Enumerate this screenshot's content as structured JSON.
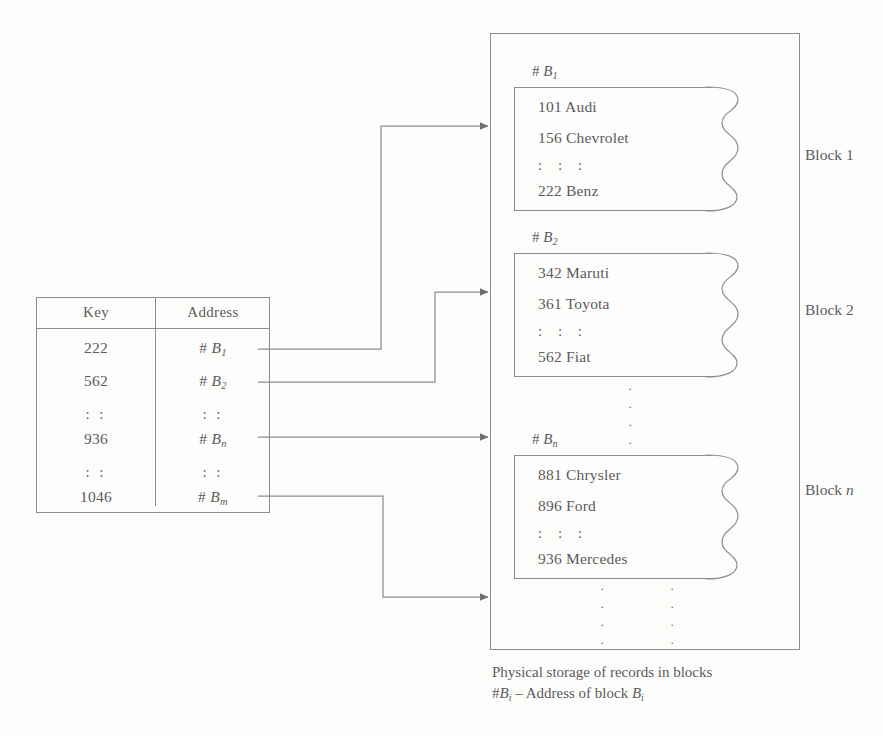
{
  "index_table": {
    "headers": [
      "Key",
      "Address"
    ],
    "rows": [
      {
        "key": "222",
        "address_prefix": "# ",
        "address_base": "B",
        "address_sub": "1"
      },
      {
        "key": "562",
        "address_prefix": "# ",
        "address_base": "B",
        "address_sub": "2"
      },
      {
        "key": ": :",
        "address_prefix": "",
        "address_base": ": :",
        "address_sub": ""
      },
      {
        "key": "936",
        "address_prefix": "# ",
        "address_base": "B",
        "address_sub": "n"
      },
      {
        "key": ": :",
        "address_prefix": "",
        "address_base": ": :",
        "address_sub": ""
      },
      {
        "key": "1046",
        "address_prefix": "# ",
        "address_base": "B",
        "address_sub": "m"
      }
    ]
  },
  "storage": {
    "blocks": [
      {
        "address_label_prefix": "# ",
        "address_label_base": "B",
        "address_label_sub": "1",
        "records": [
          "101 Audi",
          "156 Chevrolet",
          ": : :",
          "222 Benz"
        ],
        "caption": "Block 1"
      },
      {
        "address_label_prefix": "# ",
        "address_label_base": "B",
        "address_label_sub": "2",
        "records": [
          "342 Maruti",
          "361 Toyota",
          ": : :",
          "562 Fiat"
        ],
        "caption": "Block 2"
      },
      {
        "address_label_prefix": "# ",
        "address_label_base": "B",
        "address_label_sub": "n",
        "records": [
          "881 Chrysler",
          "896 Ford",
          ": : :",
          "936 Mercedes"
        ],
        "caption_prefix": "Block ",
        "caption_italic": "n"
      }
    ],
    "ellipsis_dot": "·"
  },
  "figure_caption": {
    "line1": "Physical storage of records in blocks",
    "line2_prefix": "#",
    "line2_b1": "B",
    "line2_sub1": "i",
    "line2_mid": " – Address of block ",
    "line2_b2": "B",
    "line2_sub2": "i"
  },
  "colors": {
    "line": "#8d8d8d",
    "text": "#5b5b5b",
    "background": "#fdfdfc",
    "arrow": "#6f6f6f"
  }
}
